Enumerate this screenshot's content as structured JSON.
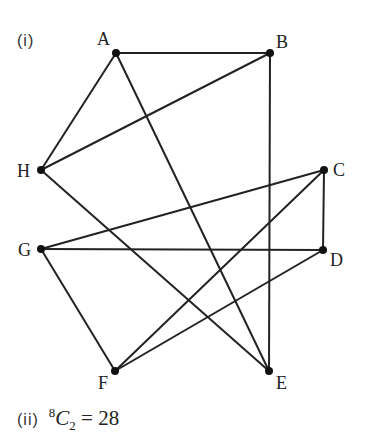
{
  "part_i_label": "(i)",
  "graph": {
    "nodes": [
      {
        "id": "A",
        "x": 116,
        "y": 53,
        "label_x": 97,
        "label_y": 45
      },
      {
        "id": "B",
        "x": 270,
        "y": 53,
        "label_x": 276,
        "label_y": 48
      },
      {
        "id": "C",
        "x": 324,
        "y": 170,
        "label_x": 333,
        "label_y": 176
      },
      {
        "id": "D",
        "x": 323,
        "y": 250,
        "label_x": 330,
        "label_y": 266
      },
      {
        "id": "E",
        "x": 269,
        "y": 371,
        "label_x": 276,
        "label_y": 389
      },
      {
        "id": "F",
        "x": 115,
        "y": 371,
        "label_x": 98,
        "label_y": 389
      },
      {
        "id": "G",
        "x": 41,
        "y": 249,
        "label_x": 18,
        "label_y": 256
      },
      {
        "id": "H",
        "x": 41,
        "y": 170,
        "label_x": 17,
        "label_y": 177
      }
    ],
    "edges": [
      [
        "A",
        "B"
      ],
      [
        "A",
        "H"
      ],
      [
        "A",
        "E"
      ],
      [
        "B",
        "H"
      ],
      [
        "B",
        "E"
      ],
      [
        "H",
        "E"
      ],
      [
        "G",
        "C"
      ],
      [
        "G",
        "D"
      ],
      [
        "G",
        "F"
      ],
      [
        "C",
        "D"
      ],
      [
        "C",
        "F"
      ],
      [
        "D",
        "F"
      ]
    ],
    "colors": {
      "edge": "#222222",
      "node": "#111111"
    }
  },
  "caption": {
    "roman": "(ii)",
    "n": "8",
    "C": "C",
    "k": "2",
    "equals": "=",
    "result": "28"
  }
}
